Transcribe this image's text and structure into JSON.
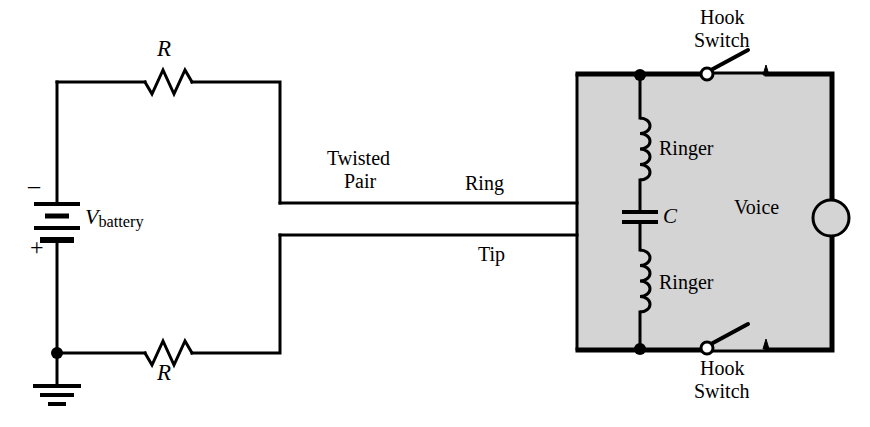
{
  "figure": {
    "type": "schematic-diagram",
    "background_color": "#ffffff",
    "line_color": "#000000",
    "shaded_box_color": "#d4d4d4"
  },
  "labels": {
    "resistor_top": "R",
    "resistor_bottom": "R",
    "battery_symbol": "V",
    "battery_subscript": "battery",
    "battery_minus": "–",
    "battery_plus": "+",
    "twisted_pair_line1": "Twisted",
    "twisted_pair_line2": "Pair",
    "ring": "Ring",
    "tip": "Tip",
    "hook_switch_top_line1": "Hook",
    "hook_switch_top_line2": "Switch",
    "hook_switch_bottom_line1": "Hook",
    "hook_switch_bottom_line2": "Switch",
    "ringer_top": "Ringer",
    "ringer_bottom": "Ringer",
    "capacitor": "C",
    "voice": "Voice"
  },
  "components": {
    "resistors": [
      {
        "name": "R",
        "position": "top-left-branch"
      },
      {
        "name": "R",
        "position": "bottom-left-branch"
      }
    ],
    "battery": {
      "name": "V_battery",
      "terminals": {
        "top": "–",
        "bottom": "+"
      }
    },
    "ground": {
      "name": "earth-ground",
      "position": "bottom-left"
    },
    "inductors": [
      {
        "name": "Ringer",
        "position": "upper"
      },
      {
        "name": "Ringer",
        "position": "lower"
      }
    ],
    "capacitor": {
      "name": "C"
    },
    "switches": [
      {
        "name": "Hook Switch",
        "state": "open",
        "position": "top"
      },
      {
        "name": "Hook Switch",
        "state": "open",
        "position": "bottom"
      }
    ],
    "voice_element": {
      "name": "Voice",
      "shape": "circle"
    },
    "transmission_line": {
      "name": "Twisted Pair",
      "conductors": [
        "Ring",
        "Tip"
      ]
    }
  }
}
